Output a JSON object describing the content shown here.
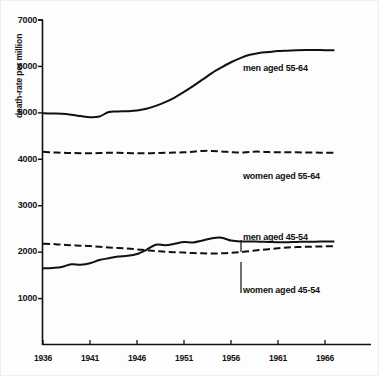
{
  "chart_data": {
    "type": "line",
    "title": "",
    "xlabel": "",
    "ylabel": "death-rate per million",
    "xlim": [
      1936,
      1971
    ],
    "ylim": [
      0,
      7000
    ],
    "grid": false,
    "legend_position": "inline-annotations",
    "xticks": [
      "1936",
      "1941",
      "1946",
      "1951",
      "1956",
      "1961",
      "1966"
    ],
    "xtick_values": [
      1936,
      1941,
      1946,
      1951,
      1956,
      1961,
      1966
    ],
    "yticks": [
      "1000",
      "2000",
      "3000",
      "4000",
      "5000",
      "6000",
      "7000"
    ],
    "ytick_values": [
      1000,
      2000,
      3000,
      4000,
      5000,
      6000,
      7000
    ],
    "x": [
      1936,
      1937,
      1938,
      1939,
      1940,
      1941,
      1942,
      1943,
      1944,
      1945,
      1946,
      1947,
      1948,
      1949,
      1950,
      1951,
      1952,
      1953,
      1954,
      1955,
      1956,
      1957,
      1958,
      1959,
      1960,
      1961,
      1962,
      1963,
      1964,
      1965,
      1966,
      1967
    ],
    "series": [
      {
        "name": "men aged 55-64",
        "style": "solid",
        "color": "#111111",
        "values": [
          4990,
          4985,
          4980,
          4960,
          4930,
          4905,
          4920,
          5020,
          5030,
          5035,
          5050,
          5090,
          5150,
          5230,
          5330,
          5450,
          5580,
          5720,
          5860,
          5980,
          6090,
          6180,
          6250,
          6290,
          6310,
          6330,
          6340,
          6350,
          6355,
          6355,
          6350,
          6350
        ]
      },
      {
        "name": "women aged 55-64",
        "style": "dashed",
        "color": "#111111",
        "values": [
          4160,
          4150,
          4140,
          4135,
          4130,
          4130,
          4135,
          4140,
          4140,
          4135,
          4130,
          4130,
          4135,
          4140,
          4145,
          4150,
          4165,
          4180,
          4180,
          4170,
          4155,
          4145,
          4160,
          4165,
          4155,
          4150,
          4150,
          4150,
          4145,
          4145,
          4140,
          4140
        ]
      },
      {
        "name": "men aged 45-54",
        "style": "solid",
        "color": "#111111",
        "values": [
          1650,
          1660,
          1680,
          1740,
          1730,
          1760,
          1830,
          1870,
          1905,
          1920,
          1960,
          2050,
          2160,
          2150,
          2180,
          2220,
          2210,
          2250,
          2300,
          2310,
          2250,
          2230,
          2230,
          2225,
          2220,
          2215,
          2215,
          2220,
          2225,
          2225,
          2230,
          2230
        ]
      },
      {
        "name": "women aged 45-54",
        "style": "dashed",
        "color": "#111111",
        "values": [
          2180,
          2175,
          2160,
          2150,
          2140,
          2130,
          2115,
          2100,
          2090,
          2080,
          2060,
          2040,
          2025,
          2010,
          2000,
          1990,
          1980,
          1975,
          1970,
          1975,
          1985,
          2000,
          2020,
          2045,
          2065,
          2085,
          2100,
          2110,
          2115,
          2120,
          2125,
          2125
        ]
      }
    ],
    "annotations": [
      {
        "text": "men aged 55-64",
        "x": 1957.5,
        "y": 6050,
        "leader": false
      },
      {
        "text": "women aged 55-64",
        "x": 1953.5,
        "y": 3650,
        "leader": false
      },
      {
        "text": "men aged 45-54",
        "x": 1957.5,
        "y": 2580,
        "leader": true
      },
      {
        "text": "women aged 45-54",
        "x": 1957.5,
        "y": 1640,
        "leader": true
      }
    ]
  },
  "labels": {
    "y_axis_title": "death-rate per million",
    "ytick_1000": "1000",
    "ytick_2000": "2000",
    "ytick_3000": "3000",
    "ytick_4000": "4000",
    "ytick_5000": "5000",
    "ytick_6000": "6000",
    "ytick_7000": "7000",
    "xtick_1936": "1936",
    "xtick_1941": "1941",
    "xtick_1946": "1946",
    "xtick_1951": "1951",
    "xtick_1956": "1956",
    "xtick_1961": "1961",
    "xtick_1966": "1966",
    "series_men_5564": "men aged 55-64",
    "series_women_5564": "women aged 55-64",
    "series_men_4554": "men aged 45-54",
    "series_women_4554": "women aged 45-54"
  }
}
